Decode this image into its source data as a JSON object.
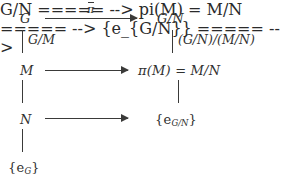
{
  "diagram": {
    "type": "commutative-diagram",
    "nodes": {
      "g": "G",
      "g_mod_n": "G/N",
      "m": "M",
      "pi_m": "π(M) = M/N",
      "n": "N",
      "e_g_mod_n": "{e",
      "e_g_mod_n_sub": "G/N",
      "e_g_mod_n_close": "}",
      "e_g": "{e",
      "e_g_sub": "G",
      "e_g_close": "}"
    },
    "edge_labels": {
      "left_top": "G/M",
      "right_top": "(G/N)/(M/N)"
    },
    "arrows": {
      "top_label": "π",
      "top_label_decoration": "overbar",
      "middle_label": "",
      "bottom_label": ""
    },
    "colors": {
      "ink": "#30302f",
      "rule": "#3a3a39",
      "background": "#ffffff"
    }
  }
}
